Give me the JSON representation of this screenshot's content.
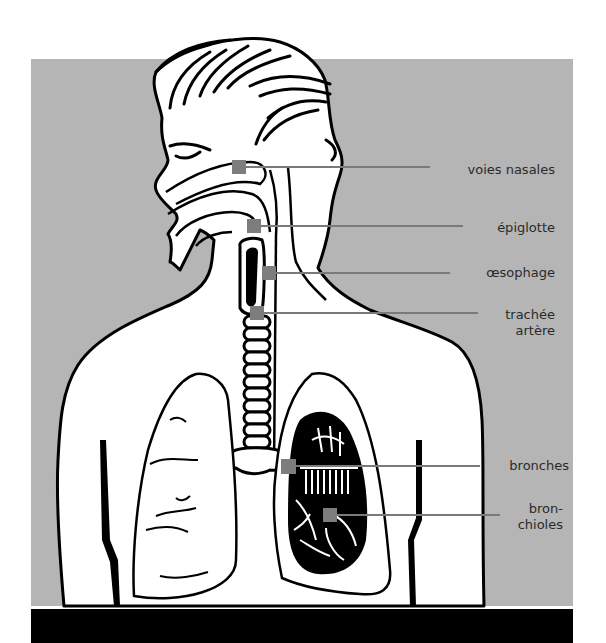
{
  "figure": {
    "colors": {
      "background_panel": "#b5b5b5",
      "bottom_bar": "#000000",
      "marker": "#7d7d7d",
      "leader_line": "#7a7a7a",
      "outline": "#000000",
      "label_text": "#2a2a2a"
    },
    "labels": [
      {
        "id": "nasal",
        "text": "voies nasales",
        "marker": [
          232,
          160
        ],
        "line_end": 430,
        "text_right": 555,
        "text_y": 162
      },
      {
        "id": "epiglottis",
        "text": "épiglotte",
        "marker": [
          247,
          219
        ],
        "line_end": 463,
        "text_right": 555,
        "text_y": 220
      },
      {
        "id": "esophagus",
        "text": "œsophage",
        "marker": [
          262,
          266
        ],
        "line_end": 450,
        "text_right": 555,
        "text_y": 265
      },
      {
        "id": "trachea",
        "line1": "trachée",
        "line2": "artère",
        "marker": [
          250,
          306
        ],
        "line_end": 478,
        "text_right": 555,
        "text_y": 307
      },
      {
        "id": "bronchi",
        "text": "bronches",
        "marker": [
          281,
          459
        ],
        "line_end": 480,
        "text_right": 569,
        "text_y": 458
      },
      {
        "id": "bronchioles",
        "line1": "bron-",
        "line2": "chioles",
        "marker": [
          323,
          508
        ],
        "line_end": 500,
        "text_right": 563,
        "text_y": 501
      }
    ]
  }
}
